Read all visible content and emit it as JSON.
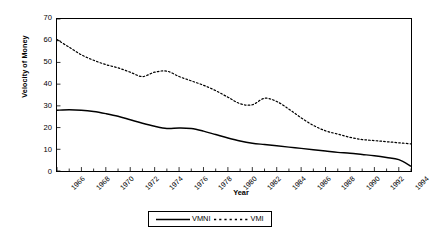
{
  "chart_data": {
    "type": "line",
    "title": "",
    "xlabel": "Year",
    "ylabel": "Velocity of Money",
    "xlim": [
      1966,
      1995
    ],
    "ylim": [
      0,
      70
    ],
    "ytick_step": 10,
    "yticks": [
      0,
      10,
      20,
      30,
      40,
      50,
      60,
      70
    ],
    "xticks": [
      1966,
      1968,
      1970,
      1972,
      1974,
      1976,
      1978,
      1980,
      1982,
      1984,
      1986,
      1988,
      1990,
      1992,
      1994
    ],
    "xtick_labels": [
      "1966",
      "1968",
      "1970",
      "1972",
      "1974",
      "1976",
      "1978",
      "1980",
      "1982",
      "1984",
      "1986",
      "1988",
      "1990",
      "1992",
      "1994"
    ],
    "grid": false,
    "legend_position": "bottom-center",
    "x": [
      1966,
      1967,
      1968,
      1969,
      1970,
      1971,
      1972,
      1973,
      1974,
      1975,
      1976,
      1977,
      1978,
      1979,
      1980,
      1981,
      1982,
      1983,
      1984,
      1985,
      1986,
      1987,
      1988,
      1989,
      1990,
      1991,
      1992,
      1993,
      1994,
      1995
    ],
    "series": [
      {
        "name": "VMNI",
        "style": "solid",
        "color": "#000000",
        "values": [
          28.0,
          28.2,
          28.0,
          27.4,
          26.4,
          25.2,
          23.6,
          22.0,
          20.6,
          19.6,
          19.8,
          19.6,
          18.4,
          16.8,
          15.2,
          13.8,
          12.8,
          12.2,
          11.6,
          11.0,
          10.4,
          9.8,
          9.2,
          8.6,
          8.2,
          7.6,
          7.0,
          6.2,
          5.2,
          2.2
        ]
      },
      {
        "name": "VMI",
        "style": "dotted",
        "color": "#000000",
        "values": [
          60.5,
          57.0,
          53.5,
          51.0,
          49.0,
          47.5,
          45.5,
          43.5,
          45.5,
          46.0,
          43.5,
          41.5,
          39.5,
          37.0,
          34.0,
          31.0,
          30.5,
          33.5,
          32.0,
          28.5,
          24.5,
          21.0,
          18.5,
          17.0,
          15.5,
          14.5,
          14.0,
          13.5,
          13.0,
          12.5
        ]
      }
    ]
  },
  "legend": {
    "entries": [
      {
        "label": "VMNI",
        "style": "solid"
      },
      {
        "label": "VMI",
        "style": "dotted"
      }
    ]
  },
  "axes": {
    "ylabel": "Velocity of Money",
    "xlabel": "Year"
  }
}
